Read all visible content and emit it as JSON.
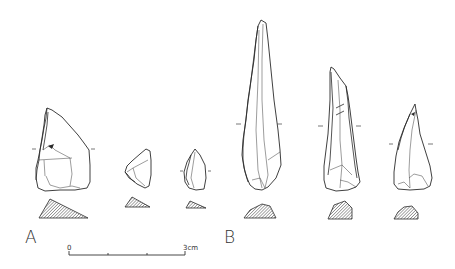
{
  "figure": {
    "groups": [
      {
        "label": "A",
        "artifacts": [
          {
            "id": "A1",
            "view": "dorsal",
            "has_section": true,
            "section_shape": "triangular"
          },
          {
            "id": "A2",
            "view": "dorsal",
            "has_section": true,
            "section_shape": "triangular"
          },
          {
            "id": "A3",
            "view": "dorsal",
            "has_section": true,
            "section_shape": "triangular"
          }
        ]
      },
      {
        "label": "B",
        "artifacts": [
          {
            "id": "B1",
            "view": "dorsal",
            "has_section": true,
            "section_shape": "trapezoidal"
          },
          {
            "id": "B2",
            "view": "dorsal",
            "has_section": true,
            "section_shape": "trapezoidal"
          },
          {
            "id": "B3",
            "view": "dorsal",
            "has_section": true,
            "section_shape": "trapezoidal"
          }
        ]
      }
    ],
    "scale_bar": {
      "start_label": "0",
      "end_label": "3cm",
      "divisions": 3
    },
    "colors": {
      "line": "#2a2a2a",
      "background": "#ffffff",
      "hatch": "#555555"
    }
  }
}
